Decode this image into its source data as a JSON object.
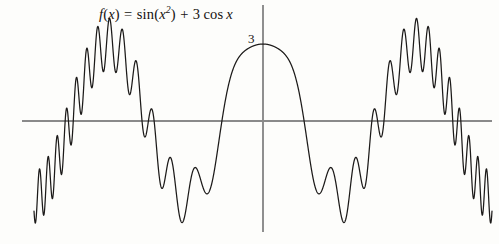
{
  "figure": {
    "background_color": "#fdfdfb",
    "width": 499,
    "height": 244
  },
  "annotations": {
    "formula": {
      "full_text": "f(x) = sin(x²) + 3 cos x",
      "f": "f",
      "paren_open": "(",
      "var_x": "x",
      "paren_close": ")",
      "equals": "=",
      "sin": "sin",
      "exponent": "2",
      "plus": "+",
      "coefficient": "3",
      "cos": "cos"
    },
    "y_peak_label": "3"
  },
  "axes": {
    "x_axis_color": "#8a8a8a",
    "y_axis_color": "#8a8a8a",
    "curve_color": "#1c1a19",
    "x_axis_y_px": 121,
    "y_axis_x_px": 263,
    "x_axis_start_px": 22,
    "x_axis_end_px": 492,
    "y_axis_top_px": 5,
    "y_axis_bottom_px": 232
  },
  "chart_data": {
    "type": "line",
    "title": "",
    "subtitle": "",
    "xlabel": "",
    "ylabel": "",
    "expression": "sin(x^2) + 3*cos(x)",
    "legend": [],
    "legend_position": "none",
    "grid": false,
    "xlim": [
      -9.35,
      9.35
    ],
    "ylim": [
      -4.3,
      4.5
    ],
    "annotations": [
      {
        "text": "f(x) = sin(x²) + 3 cos x",
        "x": -6.4,
        "y": 4.2
      },
      {
        "text": "3",
        "x": -0.45,
        "y": 3.05
      }
    ],
    "x_tick_labels": [],
    "y_tick_labels": [
      "3"
    ],
    "y_ticks": [
      3
    ],
    "series": [
      {
        "name": "f(x) = sin(x²) + 3 cos x",
        "color": "#1c1a19",
        "line_width": 1.25,
        "x_start": -9.35,
        "x_end": 9.35,
        "sample_count": 2400,
        "key_points": [
          {
            "x": 0,
            "y": 3.0
          },
          {
            "x": 1.5708,
            "y": 0.9949
          },
          {
            "x": 3.1416,
            "y": -3.4302
          },
          {
            "x": -3.1416,
            "y": -3.4302
          },
          {
            "x": 4.5,
            "y": -0.2188
          },
          {
            "x": 6.2832,
            "y": 2.9476
          },
          {
            "x": -6.2832,
            "y": 2.9476
          },
          {
            "x": 9.0,
            "y": -3.6137
          },
          {
            "x": -9.0,
            "y": -3.6137
          }
        ],
        "description": "Even symmetric function: high-frequency sin(x^2) ripple superimposed on a 3cos(x) envelope. Central lobe peaks at 3 at x=0, deep troughs near x=+/-3.2 and x=+/-9."
      }
    ]
  }
}
